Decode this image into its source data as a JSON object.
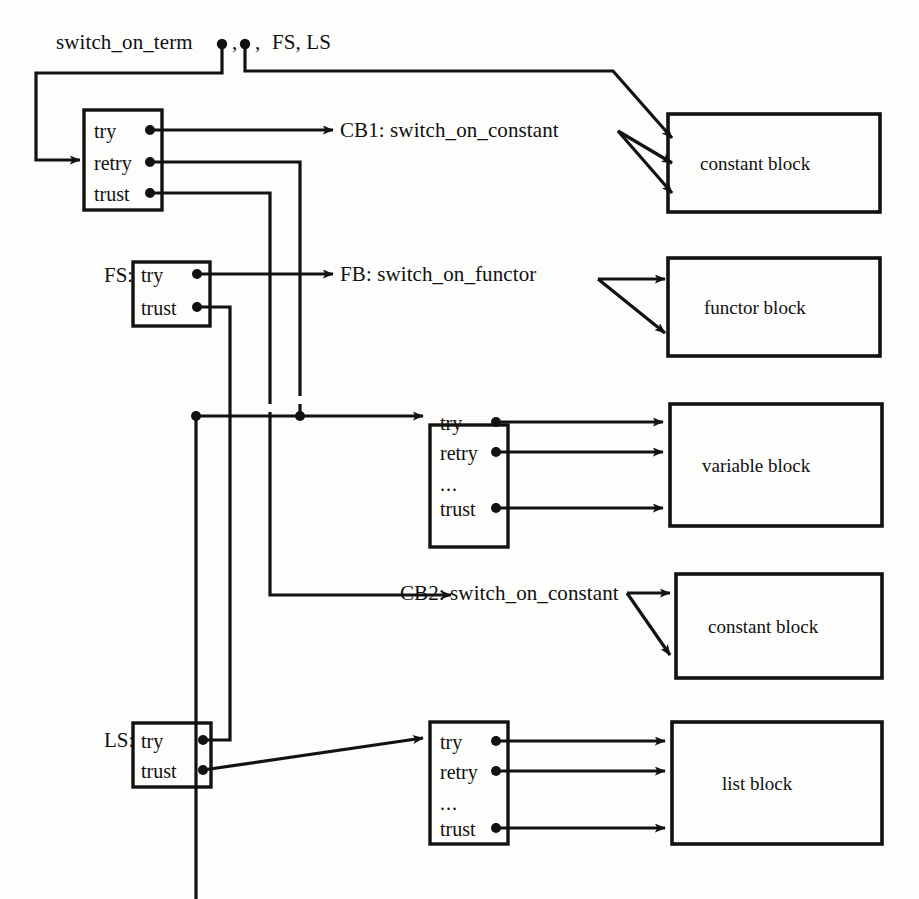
{
  "diagram": {
    "title_instruction": "switch_on_term",
    "header": {
      "instruction": "switch_on_term",
      "arg_separator_1": ",",
      "arg_separator_2": ",",
      "named_args": "FS, LS",
      "full_text": "switch_on_term • , • , FS, LS"
    },
    "labels": [
      {
        "id": "cb1",
        "text": "CB1: switch_on_constant",
        "x": 340,
        "y": 122
      },
      {
        "id": "fb",
        "text": "FB: switch_on_functor",
        "x": 340,
        "y": 268
      },
      {
        "id": "cb2",
        "text": "CB2: switch_on_constant",
        "x": 400,
        "y": 588
      },
      {
        "id": "fs_tag",
        "text": "FS:",
        "x": 104,
        "y": 272
      },
      {
        "id": "ls_tag",
        "text": "LS:",
        "x": 104,
        "y": 733
      }
    ],
    "choicepoints": [
      {
        "id": "cp-term",
        "name": "term-choicepoint",
        "x": 84,
        "y": 110,
        "w": 78,
        "h": 100,
        "fields": [
          "try",
          "retry",
          "trust"
        ]
      },
      {
        "id": "cp-fs",
        "name": "functor-structure-choicepoint",
        "x": 133,
        "y": 262,
        "w": 77,
        "h": 64,
        "fields": [
          "try",
          "trust"
        ]
      },
      {
        "id": "cp-var",
        "name": "variable-choicepoint",
        "x": 430,
        "y": 425,
        "w": 78,
        "h": 122,
        "fields": [
          "try",
          "retry",
          "...",
          "trust"
        ]
      },
      {
        "id": "cp-ls",
        "name": "list-structure-choicepoint",
        "x": 133,
        "y": 723,
        "w": 78,
        "h": 64,
        "fields": [
          "try",
          "trust"
        ]
      },
      {
        "id": "cp-list",
        "name": "list-choicepoint",
        "x": 430,
        "y": 722,
        "w": 78,
        "h": 122,
        "fields": [
          "try",
          "retry",
          "...",
          "trust"
        ]
      }
    ],
    "blocks": [
      {
        "id": "blk-const1",
        "label": "constant block",
        "x": 668,
        "y": 114,
        "w": 212,
        "h": 98,
        "incoming_arrows": 3
      },
      {
        "id": "blk-functor",
        "label": "functor block",
        "x": 668,
        "y": 258,
        "w": 212,
        "h": 98,
        "incoming_arrows": 2
      },
      {
        "id": "blk-var",
        "label": "variable block",
        "x": 670,
        "y": 404,
        "w": 212,
        "h": 122,
        "incoming_arrows": 3
      },
      {
        "id": "blk-const2",
        "label": "constant block",
        "x": 676,
        "y": 574,
        "w": 206,
        "h": 104,
        "incoming_arrows": 2
      },
      {
        "id": "blk-list",
        "label": "list block",
        "x": 672,
        "y": 722,
        "w": 210,
        "h": 122,
        "incoming_arrows": 3
      }
    ],
    "style": {
      "ink": "#121212",
      "paper": "#fdfdfb",
      "stroke_width": 3.2,
      "thin_stroke_width": 2.6
    }
  }
}
